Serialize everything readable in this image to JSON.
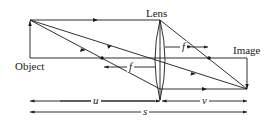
{
  "diagram": {
    "labels": {
      "lens": "Lens",
      "object": "Object",
      "image": "Image",
      "focal_left": "f",
      "focal_right": "f",
      "object_distance": "u",
      "image_distance": "v",
      "total_distance": "s"
    },
    "colors": {
      "line": "#1a1a1a",
      "background": "#ffffff"
    }
  }
}
